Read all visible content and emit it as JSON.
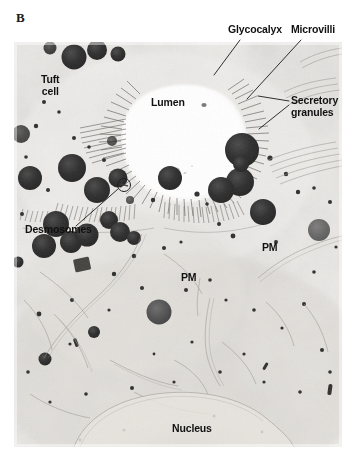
{
  "figure": {
    "panel_letter": "B",
    "type": "transmission-electron-micrograph"
  },
  "labels": {
    "glycocalyx": "Glycocalyx",
    "microvilli": "Microvilli",
    "tuft_cell": "Tuft\ncell",
    "lumen": "Lumen",
    "secretory_granules": "Secretory\ngranules",
    "desmosomes": "Desmosomes",
    "pm_right": "PM",
    "pm_left": "PM",
    "nucleus": "Nucleus"
  },
  "colors": {
    "background": "#ffffff",
    "plate_base": "#f2f1ef",
    "cytoplasm_light": "#eceae7",
    "cytoplasm_mid": "#dedbd6",
    "granule_dark": "#2b2b2b",
    "granule_mid": "#4a4a4a",
    "lumen_white": "#ffffff",
    "label_text": "#111111",
    "leader_line": "#1a1a1a"
  },
  "leader_lines": [
    {
      "name": "glycocalyx-leader",
      "x1": 240,
      "y1": 40,
      "x2": 214,
      "y2": 73
    },
    {
      "name": "microvilli-leader",
      "x1": 301,
      "y1": 40,
      "x2": 247,
      "y2": 97
    },
    {
      "name": "secretory-leader-upper",
      "x1": 289,
      "y1": 102,
      "x2": 258,
      "y2": 96
    },
    {
      "name": "secretory-leader-lower",
      "x1": 289,
      "y1": 106,
      "x2": 259,
      "y2": 128
    },
    {
      "name": "desmosome-leader",
      "x1": 74,
      "y1": 226,
      "x2": 117,
      "y2": 190
    }
  ],
  "markers": [
    {
      "name": "desmosome-circle",
      "cx": 124,
      "cy": 185,
      "r": 6.5
    }
  ]
}
